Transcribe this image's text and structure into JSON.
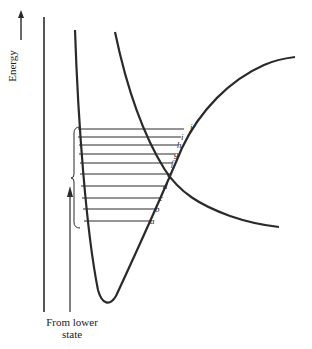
{
  "diagram": {
    "y_axis_label": "Energy",
    "source_label_line1": "From lower",
    "source_label_line2": "state",
    "level_labels": [
      "a",
      "b",
      "c",
      "d",
      "e",
      "f",
      "g",
      "h",
      "i",
      "j"
    ],
    "level_y": [
      221,
      209,
      198,
      186,
      174,
      163,
      154,
      145,
      137,
      129
    ],
    "colors": {
      "line": "#2a2a2a",
      "background": "#ffffff"
    }
  }
}
